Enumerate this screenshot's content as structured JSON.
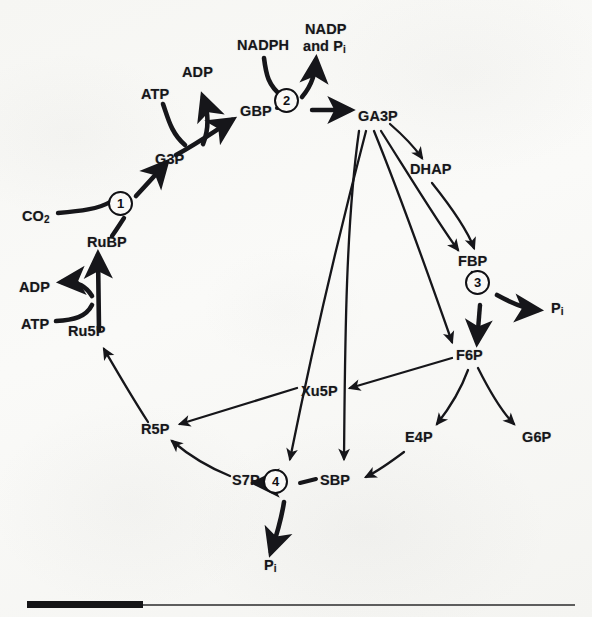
{
  "figure": {
    "ink_color": "#16161a",
    "paper_color": "#f8f8f6"
  },
  "metabolites": [
    {
      "id": "co2",
      "label": "CO",
      "sub": "2",
      "x": 22,
      "y": 217
    },
    {
      "id": "rubp",
      "label": "RuBP",
      "sub": "",
      "x": 87,
      "y": 243
    },
    {
      "id": "g3p",
      "label": "G3P",
      "sub": "",
      "x": 155,
      "y": 160
    },
    {
      "id": "atp_top",
      "label": "ATP",
      "sub": "",
      "x": 141,
      "y": 95
    },
    {
      "id": "adp_top",
      "label": "ADP",
      "sub": "",
      "x": 182,
      "y": 73
    },
    {
      "id": "gbp",
      "label": "GBP",
      "sub": "",
      "x": 240,
      "y": 112
    },
    {
      "id": "nadph",
      "label": "NADPH",
      "sub": "",
      "x": 237,
      "y": 46
    },
    {
      "id": "nadp",
      "label": "NADP",
      "sub": "",
      "x": 305,
      "y": 30
    },
    {
      "id": "nadp_line2",
      "label": "and P",
      "sub": "i",
      "x": 303,
      "y": 47
    },
    {
      "id": "ga3p",
      "label": "GA3P",
      "sub": "",
      "x": 358,
      "y": 117
    },
    {
      "id": "dhap",
      "label": "DHAP",
      "sub": "",
      "x": 410,
      "y": 170
    },
    {
      "id": "fbp",
      "label": "FBP",
      "sub": "",
      "x": 458,
      "y": 262
    },
    {
      "id": "pi_3",
      "label": "P",
      "sub": "i",
      "x": 551,
      "y": 309
    },
    {
      "id": "f6p",
      "label": "F6P",
      "sub": "",
      "x": 456,
      "y": 356
    },
    {
      "id": "xu5p",
      "label": "Xu5P",
      "sub": "",
      "x": 301,
      "y": 392
    },
    {
      "id": "e4p",
      "label": "E4P",
      "sub": "",
      "x": 405,
      "y": 438
    },
    {
      "id": "g6p",
      "label": "G6P",
      "sub": "",
      "x": 522,
      "y": 438
    },
    {
      "id": "r5p",
      "label": "R5P",
      "sub": "",
      "x": 141,
      "y": 430
    },
    {
      "id": "s7p",
      "label": "S7P",
      "sub": "",
      "x": 232,
      "y": 481
    },
    {
      "id": "sbp",
      "label": "SBP",
      "sub": "",
      "x": 320,
      "y": 481
    },
    {
      "id": "pi_4",
      "label": "P",
      "sub": "i",
      "x": 264,
      "y": 566
    },
    {
      "id": "ru5p",
      "label": "Ru5P",
      "sub": "",
      "x": 68,
      "y": 332
    },
    {
      "id": "atp_left",
      "label": "ATP",
      "sub": "",
      "x": 21,
      "y": 325
    },
    {
      "id": "adp_left",
      "label": "ADP",
      "sub": "",
      "x": 19,
      "y": 288
    }
  ],
  "enzymes": [
    {
      "id": "enzyme-1",
      "number": "1",
      "x": 120,
      "y": 203
    },
    {
      "id": "enzyme-2",
      "number": "2",
      "x": 286,
      "y": 100
    },
    {
      "id": "enzyme-3",
      "number": "3",
      "x": 477,
      "y": 282
    },
    {
      "id": "enzyme-4",
      "number": "4",
      "x": 275,
      "y": 481
    }
  ],
  "footer": {
    "bar_present": true,
    "rule_present": true
  }
}
